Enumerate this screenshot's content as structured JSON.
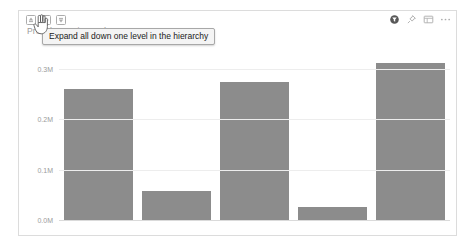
{
  "visual": {
    "title": "Profit by Region and State",
    "drill_toolbar": [
      {
        "name": "drill-up-icon",
        "label": "Drill up"
      },
      {
        "name": "drill-down-toggle-icon",
        "label": "Click to turn on Drill down"
      },
      {
        "name": "expand-all-down-icon",
        "label": "Expand all down one level in the hierarchy"
      }
    ],
    "header_actions": [
      {
        "name": "filter-icon",
        "label": "Filters"
      },
      {
        "name": "pin-icon",
        "label": "Pin visual"
      },
      {
        "name": "focus-mode-icon",
        "label": "Focus mode"
      },
      {
        "name": "more-options-icon",
        "label": "More options"
      }
    ]
  },
  "tooltip": {
    "text": "Expand all down one level in the hierarchy"
  },
  "chart_data": {
    "type": "bar",
    "title": "Profit by Region and State",
    "xlabel": "",
    "ylabel": "",
    "categories": [
      "NY",
      "NJ",
      "NC",
      "FL",
      "CT"
    ],
    "values": [
      0.26,
      0.058,
      0.275,
      0.025,
      0.312
    ],
    "value_unit": "M",
    "ylim": [
      0.0,
      0.34
    ],
    "ytick_values": [
      0.0,
      0.1,
      0.2,
      0.3
    ],
    "ytick_labels": [
      "0.0M",
      "0.1M",
      "0.2M",
      "0.3M"
    ],
    "grid": true,
    "legend": false,
    "bar_color": "#8c8c8c"
  },
  "colors": {
    "bar": "#8c8c8c",
    "gridline": "#ededed",
    "axis_text": "#9b9b9b",
    "card_border": "#dcdcdc",
    "title_text": "#9a9a9a",
    "tooltip_bg": "#f4f4f4",
    "tooltip_border": "#a8a8a8"
  }
}
